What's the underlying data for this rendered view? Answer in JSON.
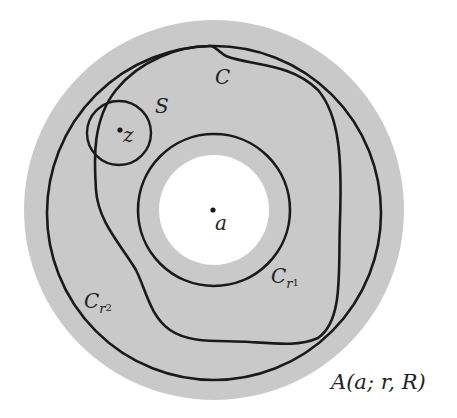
{
  "figure": {
    "colors": {
      "annulus_fill": "#c8c8c8",
      "hole_fill": "#ffffff",
      "stroke": "#1a1a1a"
    },
    "labels": {
      "center": "a",
      "point": "z",
      "small_circle": "S",
      "curve": "C",
      "inner_circle_main": "C",
      "inner_circle_sub": "r",
      "inner_circle_subsub": "1",
      "outer_circle_main": "C",
      "outer_circle_sub": "r",
      "outer_circle_subsub": "2",
      "annulus": "A(a; r, R)"
    }
  }
}
